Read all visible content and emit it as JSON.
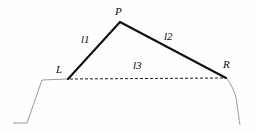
{
  "figure": {
    "type": "line-diagram",
    "background_color": "#fefefe",
    "stroke_color_primary": "#111111",
    "stroke_color_secondary": "#9a9a9a",
    "vertex_labels": {
      "peak": "P",
      "left": "L",
      "right": "R"
    },
    "segment_labels": {
      "left_slope": "l1",
      "right_slope": "l2",
      "baseline": "l3"
    },
    "geometry": {
      "peak_point": [
        120,
        22
      ],
      "left_point": [
        68,
        79
      ],
      "right_point": [
        226,
        78
      ],
      "left_tail": [
        [
          13,
          123
        ],
        [
          27,
          123
        ],
        [
          42,
          80
        ],
        [
          68,
          79
        ]
      ],
      "right_tail": [
        [
          226,
          78
        ],
        [
          233,
          90
        ],
        [
          237,
          103
        ],
        [
          240,
          125
        ]
      ],
      "baseline_dash": "3 2"
    }
  }
}
